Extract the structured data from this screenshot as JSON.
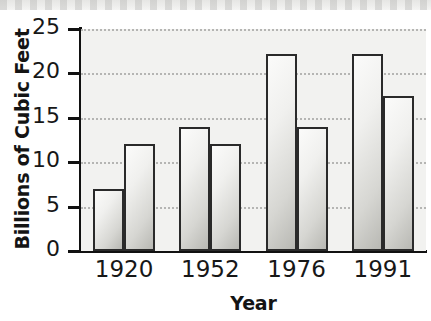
{
  "chart_data": {
    "type": "bar",
    "title": "",
    "xlabel": "Year",
    "ylabel": "Billions of Cubic Feet",
    "categories": [
      "1920",
      "1952",
      "1976",
      "1991"
    ],
    "series": [
      {
        "name": "series-1",
        "values": [
          7,
          14,
          22.2,
          22.2
        ]
      },
      {
        "name": "series-2",
        "values": [
          12,
          12,
          14,
          17.5
        ]
      }
    ],
    "ylim": [
      0,
      25
    ],
    "yticks": [
      0,
      5,
      10,
      15,
      20,
      25
    ],
    "ytick_labels": [
      "0",
      "5",
      "10",
      "15",
      "20",
      "25"
    ],
    "grid": "horizontal-dotted",
    "legend": "none",
    "bar_style": {
      "fill": "#eeeeec",
      "edge": "#2a2a2a",
      "plot_background": "#f2f2f0",
      "axis_color": "#111111",
      "grid_color": "#b5b5b3"
    }
  }
}
